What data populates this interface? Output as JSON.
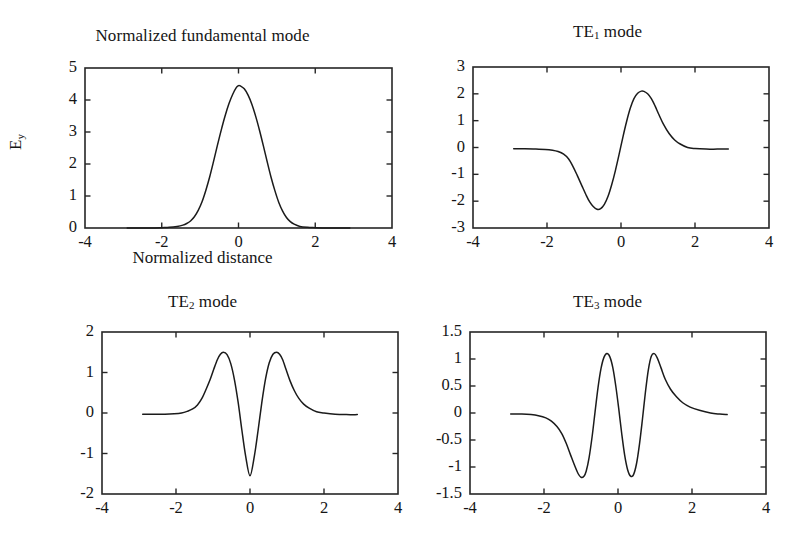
{
  "figure": {
    "background": "#ffffff",
    "line_color": "#1b1b1b",
    "axis_color": "#262626",
    "text_color": "#151515"
  },
  "axis_labels": {
    "y_main": "E",
    "y_main_sub": "y",
    "x_main": "Normalized distance"
  },
  "chart_data": [
    {
      "type": "line",
      "panel": "top-left",
      "title": "Normalized fundamental mode",
      "title_sub": "",
      "xlabel": "Normalized distance",
      "ylabel": "E_y",
      "xlim": [
        -4,
        4
      ],
      "ylim": [
        0,
        5
      ],
      "xticks": [
        -4,
        -2,
        0,
        2,
        4
      ],
      "xticklabels": [
        "-4",
        "-2",
        "0",
        "2",
        "4"
      ],
      "yticks": [
        0,
        1,
        2,
        3,
        4,
        5
      ],
      "yticklabels": [
        "0",
        "1",
        "2",
        "3",
        "4",
        "5"
      ],
      "grid": false,
      "legend": "none",
      "series": [
        {
          "name": "fundamental",
          "x": [
            -2.9,
            -2.6,
            -2.3,
            -2.0,
            -1.8,
            -1.6,
            -1.45,
            -1.35,
            -1.25,
            -1.15,
            -1.05,
            -0.95,
            -0.85,
            -0.75,
            -0.65,
            -0.55,
            -0.45,
            -0.35,
            -0.25,
            -0.15,
            -0.05,
            0.0,
            0.05,
            0.15,
            0.25,
            0.35,
            0.45,
            0.55,
            0.65,
            0.75,
            0.85,
            0.95,
            1.05,
            1.15,
            1.25,
            1.35,
            1.45,
            1.6,
            1.8,
            2.0,
            2.3,
            2.6,
            2.9
          ],
          "y": [
            0.0,
            0.0,
            0.0,
            0.01,
            0.02,
            0.05,
            0.09,
            0.14,
            0.22,
            0.35,
            0.55,
            0.82,
            1.18,
            1.6,
            2.08,
            2.58,
            3.06,
            3.5,
            3.88,
            4.18,
            4.4,
            4.45,
            4.44,
            4.35,
            4.15,
            3.86,
            3.48,
            3.04,
            2.56,
            2.06,
            1.58,
            1.16,
            0.8,
            0.53,
            0.33,
            0.2,
            0.12,
            0.05,
            0.02,
            0.01,
            0.0,
            0.0,
            0.0
          ]
        }
      ]
    },
    {
      "type": "line",
      "panel": "top-right",
      "title": "TE",
      "title_sub": "1",
      "title_suffix": " mode",
      "xlabel": "",
      "ylabel": "",
      "xlim": [
        -4,
        4
      ],
      "ylim": [
        -3,
        3
      ],
      "xticks": [
        -4,
        -2,
        0,
        2,
        4
      ],
      "xticklabels": [
        "-4",
        "-2",
        "0",
        "2",
        "4"
      ],
      "yticks": [
        -3,
        -2,
        -1,
        0,
        1,
        2,
        3
      ],
      "yticklabels": [
        "-3",
        "-2",
        "-1",
        "0",
        "1",
        "2",
        "3"
      ],
      "grid": false,
      "legend": "none",
      "series": [
        {
          "name": "TE1",
          "x": [
            -2.9,
            -2.6,
            -2.3,
            -2.05,
            -1.85,
            -1.7,
            -1.55,
            -1.42,
            -1.3,
            -1.18,
            -1.05,
            -0.95,
            -0.85,
            -0.75,
            -0.65,
            -0.55,
            -0.45,
            -0.35,
            -0.25,
            -0.15,
            -0.05,
            0.05,
            0.15,
            0.25,
            0.35,
            0.45,
            0.55,
            0.62,
            0.72,
            0.82,
            0.92,
            1.02,
            1.15,
            1.3,
            1.45,
            1.6,
            1.8,
            2.0,
            2.3,
            2.6,
            2.9
          ],
          "y": [
            -0.05,
            -0.05,
            -0.06,
            -0.07,
            -0.1,
            -0.15,
            -0.25,
            -0.42,
            -0.7,
            -1.05,
            -1.45,
            -1.75,
            -2.02,
            -2.2,
            -2.3,
            -2.28,
            -2.12,
            -1.82,
            -1.38,
            -0.85,
            -0.25,
            0.38,
            0.96,
            1.46,
            1.82,
            2.02,
            2.1,
            2.09,
            2.0,
            1.82,
            1.55,
            1.24,
            0.86,
            0.52,
            0.28,
            0.13,
            0.0,
            -0.04,
            -0.06,
            -0.06,
            -0.06
          ]
        }
      ]
    },
    {
      "type": "line",
      "panel": "bottom-left",
      "title": "TE",
      "title_sub": "2",
      "title_suffix": " mode",
      "xlabel": "",
      "ylabel": "",
      "xlim": [
        -4,
        4
      ],
      "ylim": [
        -2,
        2
      ],
      "xticks": [
        -4,
        -2,
        0,
        2,
        4
      ],
      "xticklabels": [
        "-4",
        "-2",
        "0",
        "2",
        "4"
      ],
      "yticks": [
        -2,
        -1,
        0,
        1,
        2
      ],
      "yticklabels": [
        "-2",
        "-1",
        "0",
        "1",
        "2"
      ],
      "grid": false,
      "legend": "none",
      "series": [
        {
          "name": "TE2",
          "x": [
            -2.9,
            -2.6,
            -2.3,
            -2.05,
            -1.85,
            -1.7,
            -1.55,
            -1.42,
            -1.3,
            -1.18,
            -1.08,
            -0.98,
            -0.88,
            -0.8,
            -0.72,
            -0.62,
            -0.52,
            -0.42,
            -0.32,
            -0.22,
            -0.12,
            0.0,
            0.12,
            0.22,
            0.32,
            0.42,
            0.52,
            0.62,
            0.72,
            0.8,
            0.88,
            0.98,
            1.08,
            1.2,
            1.32,
            1.45,
            1.6,
            1.8,
            2.0,
            2.3,
            2.6,
            2.9
          ],
          "y": [
            -0.03,
            -0.03,
            -0.03,
            -0.02,
            0.0,
            0.04,
            0.1,
            0.2,
            0.36,
            0.6,
            0.82,
            1.08,
            1.32,
            1.45,
            1.5,
            1.44,
            1.22,
            0.82,
            0.26,
            -0.42,
            -1.05,
            -1.55,
            -1.05,
            -0.42,
            0.26,
            0.84,
            1.24,
            1.45,
            1.5,
            1.45,
            1.32,
            1.06,
            0.8,
            0.55,
            0.36,
            0.22,
            0.12,
            0.03,
            0.0,
            -0.03,
            -0.04,
            -0.04
          ]
        }
      ]
    },
    {
      "type": "line",
      "panel": "bottom-right",
      "title": "TE",
      "title_sub": "3",
      "title_suffix": " mode",
      "xlabel": "",
      "ylabel": "",
      "xlim": [
        -4,
        4
      ],
      "ylim": [
        -1.5,
        1.5
      ],
      "xticks": [
        -4,
        -2,
        0,
        2,
        4
      ],
      "xticklabels": [
        "-4",
        "-2",
        "0",
        "2",
        "4"
      ],
      "yticks": [
        -1.5,
        -1,
        -0.5,
        0,
        0.5,
        1,
        1.5
      ],
      "yticklabels": [
        "-1.5",
        "-1",
        "-0.5",
        "0",
        "0.5",
        "1",
        "1.5"
      ],
      "grid": false,
      "legend": "none",
      "series": [
        {
          "name": "TE3",
          "x": [
            -2.9,
            -2.6,
            -2.35,
            -2.15,
            -1.95,
            -1.8,
            -1.65,
            -1.52,
            -1.4,
            -1.28,
            -1.18,
            -1.08,
            -1.0,
            -0.92,
            -0.86,
            -0.78,
            -0.7,
            -0.62,
            -0.54,
            -0.46,
            -0.38,
            -0.3,
            -0.22,
            -0.14,
            -0.06,
            0.02,
            0.1,
            0.18,
            0.26,
            0.34,
            0.42,
            0.5,
            0.58,
            0.66,
            0.74,
            0.82,
            0.9,
            0.98,
            1.06,
            1.16,
            1.28,
            1.42,
            1.58,
            1.75,
            1.95,
            2.2,
            2.5,
            2.75,
            2.95
          ],
          "y": [
            -0.02,
            -0.02,
            -0.03,
            -0.05,
            -0.09,
            -0.15,
            -0.25,
            -0.38,
            -0.56,
            -0.78,
            -0.96,
            -1.12,
            -1.19,
            -1.17,
            -1.08,
            -0.82,
            -0.44,
            0.02,
            0.47,
            0.82,
            1.03,
            1.1,
            1.04,
            0.84,
            0.5,
            0.08,
            -0.38,
            -0.78,
            -1.05,
            -1.17,
            -1.14,
            -0.94,
            -0.58,
            -0.12,
            0.38,
            0.8,
            1.05,
            1.1,
            1.02,
            0.84,
            0.62,
            0.44,
            0.3,
            0.19,
            0.11,
            0.05,
            0.0,
            -0.02,
            -0.03
          ]
        }
      ]
    }
  ]
}
